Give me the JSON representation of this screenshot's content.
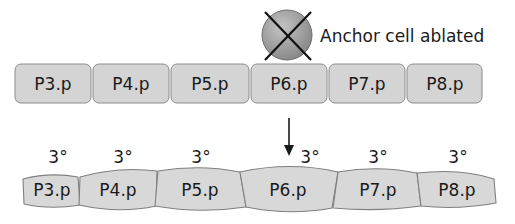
{
  "anchor": {
    "label": "Anchor cell ablated",
    "state": "ablated"
  },
  "top_row": {
    "cells": [
      {
        "label": "P3.p"
      },
      {
        "label": "P4.p"
      },
      {
        "label": "P5.p"
      },
      {
        "label": "P6.p"
      },
      {
        "label": "P7.p"
      },
      {
        "label": "P8.p"
      }
    ]
  },
  "fates": [
    "3°",
    "3°",
    "3°",
    "3°",
    "3°",
    "3°"
  ],
  "bottom_row": {
    "cells": [
      {
        "label": "P3.p"
      },
      {
        "label": "P4.p"
      },
      {
        "label": "P5.p"
      },
      {
        "label": "P6.p"
      },
      {
        "label": "P7.p"
      },
      {
        "label": "P8.p"
      }
    ]
  },
  "colors": {
    "cell_fill": "#d4d4d4",
    "cell_stroke": "#8c8c8c",
    "anchor_fill": "#9a9a9a",
    "text": "#1a1a1a"
  }
}
